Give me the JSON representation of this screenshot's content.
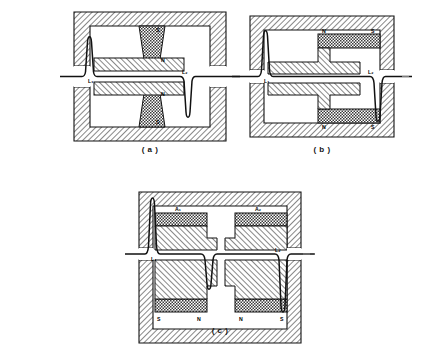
{
  "document": {
    "type": "technical-illustration",
    "title": "Magnetic circuit cross-sections"
  },
  "figures": [
    {
      "id": "a",
      "caption": "( a )",
      "contact_labels": [
        "L₁",
        "L₂"
      ],
      "pole_labels_upper": [
        "S",
        "N"
      ],
      "pole_labels_lower": [
        "N",
        "S"
      ],
      "magnet_count": 2,
      "description": "Single central tapered magnet pair with opposing pole pieces"
    },
    {
      "id": "b",
      "caption": "( b )",
      "contact_labels": [
        "L₁",
        "L₂"
      ],
      "pole_labels_upper": [
        "N",
        "S"
      ],
      "pole_labels_lower": [
        "N",
        "S"
      ],
      "magnet_count": 2,
      "description": "Offset horizontal magnets with stepped pole pieces"
    },
    {
      "id": "c",
      "caption": "( c )",
      "contact_labels": [
        "L₁",
        "L₂"
      ],
      "magnet_labels_upper": [
        "A₁",
        "A₂"
      ],
      "pole_labels_lower": [
        "S",
        "N",
        "N",
        "S"
      ],
      "magnet_count": 4,
      "description": "Dual symmetric magnet pairs with twin reed gaps"
    }
  ],
  "legend_keys": {
    "frame": "hatched-steel-frame",
    "magnet": "checkered-permanent-magnet",
    "pole_piece": "hatched-pole-piece",
    "reed": "reed-blade-curve"
  },
  "colors": {
    "line": "#111111",
    "frame_fill": "#ffffff",
    "magnet_fill": "#6e6e6e",
    "background": "#ffffff"
  }
}
